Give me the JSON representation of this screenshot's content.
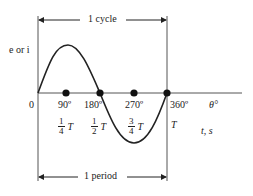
{
  "diagram": {
    "type": "sinusoidal-waveform",
    "y_axis_label": "e or i",
    "top_span_label": "1 cycle",
    "bottom_span_label": "1 period",
    "origin_label": "0",
    "angle_axis_label": "θ°",
    "time_axis_label": "t, s",
    "angle_ticks": [
      {
        "label": "90º",
        "x": 66
      },
      {
        "label": "180º",
        "x": 100
      },
      {
        "label": "270º",
        "x": 134
      },
      {
        "label": "360º",
        "x": 167
      }
    ],
    "time_ticks": [
      {
        "num": "1",
        "den": "4",
        "sym": "T"
      },
      {
        "num": "1",
        "den": "2",
        "sym": "T"
      },
      {
        "num": "3",
        "den": "4",
        "sym": "T"
      },
      {
        "sym": "T"
      }
    ],
    "colors": {
      "line": "#222222",
      "dot": "#111111",
      "background": "#ffffff"
    }
  }
}
